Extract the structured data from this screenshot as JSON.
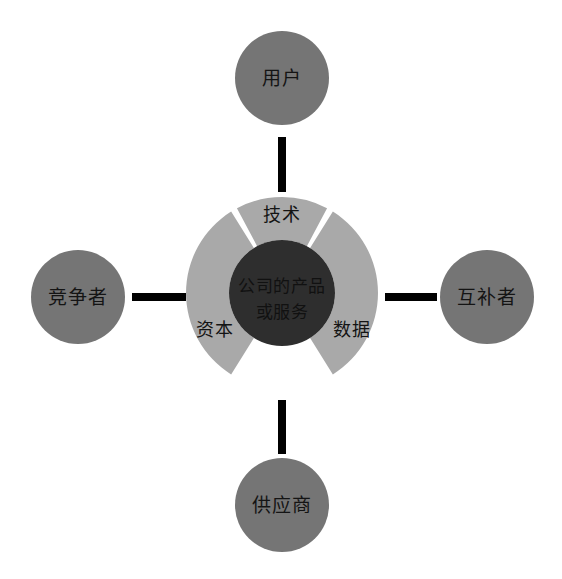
{
  "diagram": {
    "background_color": "#ffffff",
    "canvas": {
      "width": 562,
      "height": 579
    },
    "core": {
      "name": "company-core",
      "lines": [
        "公司的产品",
        "或服务"
      ],
      "fill": "#2e2e2e",
      "text_color": "#111111",
      "cx": 282,
      "cy": 293,
      "r": 53
    },
    "ring": {
      "name": "resource-ring",
      "fill": "#a9a9a9",
      "cx": 282,
      "cy": 293,
      "outer_r": 96,
      "inner_r": 53,
      "gap_color": "#ffffff",
      "segments": [
        {
          "name": "ring-segment-technology",
          "label": "技术",
          "start_angle": -120,
          "end_angle": -60,
          "label_x": 282,
          "label_y": 216
        },
        {
          "name": "ring-segment-capital",
          "label": "资本",
          "start_angle": 120,
          "end_angle": 240,
          "label_x": 215,
          "label_y": 331
        },
        {
          "name": "ring-segment-data",
          "label": "数据",
          "start_angle": -60,
          "end_angle": 60,
          "label_x": 352,
          "label_y": 331
        }
      ]
    },
    "outer_nodes": [
      {
        "name": "node-users",
        "label": "用户",
        "position": "top",
        "cx": 282,
        "cy": 78,
        "r": 47,
        "fill": "#757575",
        "text_color": "#141414"
      },
      {
        "name": "node-competitors",
        "label": "竞争者",
        "position": "left",
        "cx": 78,
        "cy": 297,
        "r": 47,
        "fill": "#757575",
        "text_color": "#141414"
      },
      {
        "name": "node-complementors",
        "label": "互补者",
        "position": "right",
        "cx": 487,
        "cy": 297,
        "r": 47,
        "fill": "#757575",
        "text_color": "#141414"
      },
      {
        "name": "node-suppliers",
        "label": "供应商",
        "position": "bottom",
        "cx": 282,
        "cy": 505,
        "r": 47,
        "fill": "#757575",
        "text_color": "#141414"
      }
    ],
    "connectors": [
      {
        "name": "connector-top",
        "color": "#000000",
        "thickness": 8,
        "x1": 282,
        "y1": 137,
        "x2": 282,
        "y2": 192
      },
      {
        "name": "connector-left",
        "color": "#000000",
        "thickness": 8,
        "x1": 132,
        "y1": 297,
        "x2": 186,
        "y2": 297
      },
      {
        "name": "connector-right",
        "color": "#000000",
        "thickness": 8,
        "x1": 385,
        "y1": 297,
        "x2": 437,
        "y2": 297
      },
      {
        "name": "connector-bottom",
        "color": "#000000",
        "thickness": 8,
        "x1": 282,
        "y1": 400,
        "x2": 282,
        "y2": 454
      }
    ]
  }
}
